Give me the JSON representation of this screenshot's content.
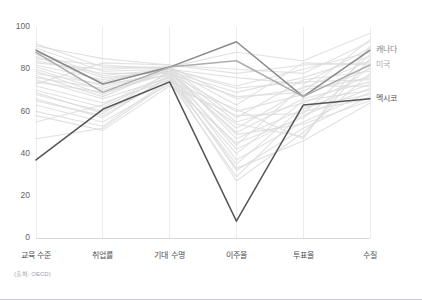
{
  "chart_data": {
    "type": "line",
    "subtype": "parallel-coordinates",
    "title": "",
    "xlabel": "",
    "ylabel": "",
    "ylim": [
      0,
      100
    ],
    "yticks": [
      0,
      20,
      40,
      60,
      80,
      100
    ],
    "grid": true,
    "legend_position": "right-inline",
    "categories": [
      "교육 수준",
      "취업률",
      "기대 수명",
      "이주율",
      "투표율",
      "수질"
    ],
    "source_note": "(출처: OECD)",
    "highlight_colors": {
      "canada": "#8a8a8a",
      "usa": "#adadad",
      "mexico": "#555555",
      "background": "#dcdcdc"
    },
    "series": [
      {
        "name": "캐나다",
        "highlight": true,
        "color": "#8a8a8a",
        "values": [
          89,
          73,
          81,
          93,
          67,
          89
        ]
      },
      {
        "name": "미국",
        "highlight": true,
        "color": "#adadad",
        "values": [
          88,
          69,
          81,
          84,
          67,
          82
        ]
      },
      {
        "name": "멕시코",
        "highlight": true,
        "color": "#555555",
        "values": [
          37,
          61,
          74,
          8,
          63,
          66
        ]
      },
      {
        "name": "배경국가 1",
        "highlight": false,
        "color": "#dcdcdc",
        "values": [
          92,
          81,
          81,
          88,
          84,
          97
        ]
      },
      {
        "name": "배경국가 2",
        "highlight": false,
        "color": "#dcdcdc",
        "values": [
          91,
          85,
          82,
          80,
          78,
          93
        ]
      },
      {
        "name": "배경국가 3",
        "highlight": false,
        "color": "#dcdcdc",
        "values": [
          90,
          79,
          80,
          76,
          73,
          90
        ]
      },
      {
        "name": "배경국가 4",
        "highlight": false,
        "color": "#dcdcdc",
        "values": [
          88,
          77,
          80,
          72,
          80,
          88
        ]
      },
      {
        "name": "배경국가 5",
        "highlight": false,
        "color": "#dcdcdc",
        "values": [
          87,
          76,
          79,
          69,
          76,
          86
        ]
      },
      {
        "name": "배경국가 6",
        "highlight": false,
        "color": "#dcdcdc",
        "values": [
          86,
          74,
          81,
          66,
          71,
          84
        ]
      },
      {
        "name": "배경국가 7",
        "highlight": false,
        "color": "#dcdcdc",
        "values": [
          85,
          82,
          80,
          63,
          83,
          82
        ]
      },
      {
        "name": "배경국가 8",
        "highlight": false,
        "color": "#dcdcdc",
        "values": [
          84,
          78,
          78,
          60,
          68,
          80
        ]
      },
      {
        "name": "배경국가 9",
        "highlight": false,
        "color": "#dcdcdc",
        "values": [
          83,
          80,
          81,
          57,
          75,
          79
        ]
      },
      {
        "name": "배경국가 10",
        "highlight": false,
        "color": "#dcdcdc",
        "values": [
          82,
          75,
          80,
          55,
          64,
          77
        ]
      },
      {
        "name": "배경국가 11",
        "highlight": false,
        "color": "#dcdcdc",
        "values": [
          81,
          72,
          79,
          52,
          70,
          76
        ]
      },
      {
        "name": "배경국가 12",
        "highlight": false,
        "color": "#dcdcdc",
        "values": [
          80,
          70,
          78,
          50,
          66,
          74
        ]
      },
      {
        "name": "배경국가 13",
        "highlight": false,
        "color": "#dcdcdc",
        "values": [
          79,
          68,
          80,
          47,
          61,
          73
        ]
      },
      {
        "name": "배경국가 14",
        "highlight": false,
        "color": "#dcdcdc",
        "values": [
          78,
          73,
          77,
          44,
          72,
          72
        ]
      },
      {
        "name": "배경국가 15",
        "highlight": false,
        "color": "#dcdcdc",
        "values": [
          76,
          71,
          79,
          42,
          58,
          71
        ]
      },
      {
        "name": "배경국가 16",
        "highlight": false,
        "color": "#dcdcdc",
        "values": [
          75,
          66,
          76,
          40,
          65,
          70
        ]
      },
      {
        "name": "배경국가 17",
        "highlight": false,
        "color": "#dcdcdc",
        "values": [
          74,
          69,
          78,
          37,
          55,
          69
        ]
      },
      {
        "name": "배경국가 18",
        "highlight": false,
        "color": "#dcdcdc",
        "values": [
          72,
          64,
          75,
          35,
          62,
          68
        ]
      },
      {
        "name": "배경국가 19",
        "highlight": false,
        "color": "#dcdcdc",
        "values": [
          70,
          62,
          77,
          32,
          52,
          67
        ]
      },
      {
        "name": "배경국가 20",
        "highlight": false,
        "color": "#dcdcdc",
        "values": [
          68,
          60,
          74,
          29,
          60,
          66
        ]
      },
      {
        "name": "배경국가 21",
        "highlight": false,
        "color": "#dcdcdc",
        "values": [
          65,
          58,
          76,
          27,
          50,
          78
        ]
      },
      {
        "name": "배경국가 22",
        "highlight": false,
        "color": "#dcdcdc",
        "values": [
          63,
          55,
          73,
          45,
          57,
          81
        ]
      },
      {
        "name": "배경국가 23",
        "highlight": false,
        "color": "#dcdcdc",
        "values": [
          60,
          53,
          75,
          54,
          48,
          85
        ]
      },
      {
        "name": "배경국가 24",
        "highlight": false,
        "color": "#dcdcdc",
        "values": [
          58,
          51,
          72,
          58,
          59,
          87
        ]
      },
      {
        "name": "배경국가 25",
        "highlight": false,
        "color": "#dcdcdc",
        "values": [
          47,
          52,
          74,
          61,
          47,
          91
        ]
      },
      {
        "name": "배경국가 26",
        "highlight": false,
        "color": "#dcdcdc",
        "values": [
          55,
          63,
          78,
          67,
          69,
          94
        ]
      },
      {
        "name": "배경국가 27",
        "highlight": false,
        "color": "#dcdcdc",
        "values": [
          77,
          67,
          80,
          71,
          74,
          75
        ]
      },
      {
        "name": "배경국가 28",
        "highlight": false,
        "color": "#dcdcdc",
        "values": [
          73,
          83,
          82,
          78,
          82,
          83
        ]
      },
      {
        "name": "배경국가 29",
        "highlight": false,
        "color": "#dcdcdc",
        "values": [
          69,
          59,
          79,
          49,
          54,
          65
        ]
      },
      {
        "name": "배경국가 30",
        "highlight": false,
        "color": "#dcdcdc",
        "values": [
          66,
          57,
          77,
          33,
          46,
          64
        ]
      }
    ]
  },
  "axis": {
    "y_tick_labels": [
      "0",
      "20",
      "40",
      "60",
      "80",
      "100"
    ]
  }
}
